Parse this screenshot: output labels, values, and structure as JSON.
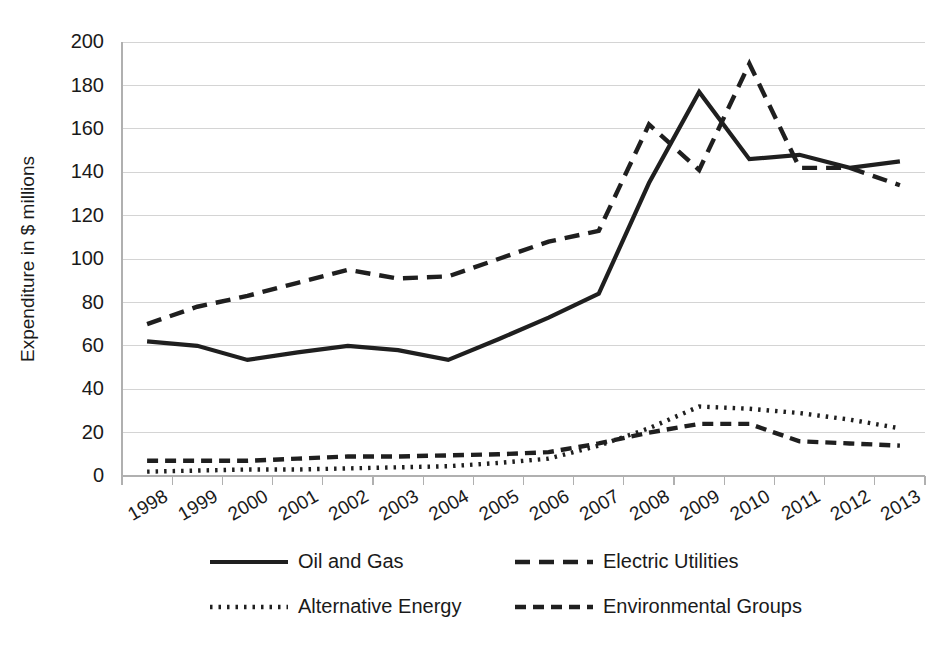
{
  "chart_data": {
    "type": "line",
    "title": "",
    "subtitle": "",
    "xlabel": "",
    "ylabel": "Expenditure in $ millions",
    "ylim": [
      0,
      200
    ],
    "ytick_step": 20,
    "yticks": [
      "0",
      "20",
      "40",
      "60",
      "80",
      "100",
      "120",
      "140",
      "160",
      "180",
      "200"
    ],
    "grid": true,
    "legend_position": "bottom",
    "categories": [
      "1998",
      "1999",
      "2000",
      "2001",
      "2002",
      "2003",
      "2004",
      "2005",
      "2006",
      "2007",
      "2008",
      "2009",
      "2010",
      "2011",
      "2012",
      "2013"
    ],
    "series": [
      {
        "name": "Oil and Gas",
        "style": "solid",
        "color": "#1f1f1f",
        "values": [
          62,
          60,
          53.5,
          57,
          60,
          58,
          53.5,
          63,
          73,
          84,
          135,
          177,
          146,
          148,
          142,
          145
        ]
      },
      {
        "name": "Electric Utilities",
        "style": "long-dash",
        "color": "#1f1f1f",
        "values": [
          70,
          78,
          83,
          89,
          95,
          91,
          92,
          100,
          108,
          113,
          162,
          141,
          190,
          142,
          142,
          134
        ]
      },
      {
        "name": "Alternative Energy",
        "style": "dotted",
        "color": "#1f1f1f",
        "values": [
          2,
          2.5,
          3,
          3,
          3.5,
          4,
          4.5,
          6,
          8,
          14,
          22,
          32,
          31,
          29,
          26,
          22
        ]
      },
      {
        "name": "Environmental Groups",
        "style": "dash",
        "color": "#1f1f1f",
        "values": [
          7,
          7,
          7,
          8,
          9,
          9,
          9.5,
          10,
          11,
          15,
          20,
          24,
          24,
          16,
          15,
          14
        ]
      }
    ]
  },
  "legend": {
    "entries": [
      {
        "label": "Oil and Gas",
        "style": "solid"
      },
      {
        "label": "Electric Utilities",
        "style": "long-dash"
      },
      {
        "label": "Alternative Energy",
        "style": "dotted"
      },
      {
        "label": "Environmental Groups",
        "style": "dash"
      }
    ]
  },
  "colors": {
    "background": "#ffffff",
    "ink": "#1f1f1f",
    "gridline": "#d4d4d4",
    "axis": "#b0b0b0"
  }
}
